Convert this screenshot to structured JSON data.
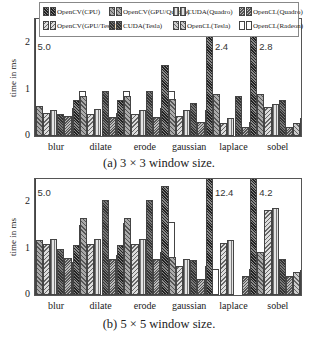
{
  "chart_data": [
    {
      "type": "bar",
      "title": "(a) 3 × 3 window size.",
      "xlabel": "",
      "ylabel": "time in ms",
      "ylim": [
        0,
        2.5
      ],
      "yticks": [
        "0",
        "1",
        "2"
      ],
      "grid": false,
      "legend_position": "top inside",
      "categories": [
        "blur",
        "dilate",
        "erode",
        "gaussian",
        "laplace",
        "sobel"
      ],
      "series_label_note": "Bar slots are ordered left to right within each group. Slot 1 is OpenCV(CPU) (dark crosshatch, tallest) and slot 8 is OpenCL(Radeon) (white bar). The labels on slots 2-7 are inferred from legend order and were not confirmed by matching bar fill to legend swatch.",
      "series": [
        {
          "slot": 1,
          "name": "OpenCV(CPU)",
          "label_confidence": "confirmed",
          "values": [
            5.0,
            0.77,
            0.77,
            1.52,
            2.4,
            2.8
          ]
        },
        {
          "slot": 2,
          "name": "OpenCV(GPU/Quadro)",
          "label_confidence": "inferred",
          "values": [
            0.65,
            0.85,
            0.85,
            0.8,
            0.9,
            0.9
          ]
        },
        {
          "slot": 3,
          "name": "OpenCV(GPU/Tesla)",
          "label_confidence": "inferred",
          "values": [
            0.5,
            0.48,
            0.47,
            0.44,
            0.27,
            0.62
          ]
        },
        {
          "slot": 4,
          "name": "CUDA(Quadro)",
          "label_confidence": "inferred",
          "values": [
            0.57,
            0.58,
            0.57,
            0.55,
            0.38,
            0.68
          ]
        },
        {
          "slot": 5,
          "name": "CUDA(Tesla)",
          "label_confidence": "inferred",
          "values": [
            0.48,
            0.97,
            0.97,
            0.72,
            0.87,
            0.78
          ]
        },
        {
          "slot": 6,
          "name": "OpenCL(Quadro)",
          "label_confidence": "inferred",
          "values": [
            0.42,
            0.4,
            0.4,
            0.3,
            0.2,
            0.2
          ]
        },
        {
          "slot": 7,
          "name": "OpenCL(Tesla)",
          "label_confidence": "inferred",
          "values": [
            0.6,
            0.5,
            0.6,
            0.55,
            0.3,
            0.27
          ]
        },
        {
          "slot": 8,
          "name": "OpenCL(Radeon)",
          "label_confidence": "confirmed",
          "values": [
            0.97,
            0.97,
            0.97,
            0.5,
            0.4,
            0.38
          ]
        }
      ],
      "annotations": [
        {
          "category": "blur",
          "text": "5.0"
        },
        {
          "category": "laplace",
          "text": "2.4"
        },
        {
          "category": "sobel",
          "text": "2.8"
        }
      ]
    },
    {
      "type": "bar",
      "title": "(b) 5 × 5 window size.",
      "xlabel": "",
      "ylabel": "time in ms",
      "ylim": [
        0,
        2.5
      ],
      "yticks": [
        "0",
        "1",
        "2"
      ],
      "grid": false,
      "categories": [
        "blur",
        "dilate",
        "erode",
        "gaussian",
        "laplace",
        "sobel"
      ],
      "series_label_note": "Same slot ordering and label caveat as panel (a).",
      "series": [
        {
          "slot": 1,
          "name": "OpenCV(CPU)",
          "label_confidence": "confirmed",
          "values": [
            5.0,
            1.07,
            1.07,
            2.35,
            12.4,
            4.2
          ]
        },
        {
          "slot": 2,
          "name": "OpenCV(GPU/Quadro)",
          "label_confidence": "inferred",
          "values": [
            1.18,
            1.65,
            1.65,
            0.82,
            0,
            0.93
          ]
        },
        {
          "slot": 3,
          "name": "OpenCV(GPU/Tesla)",
          "label_confidence": "inferred",
          "values": [
            1.1,
            1.1,
            1.1,
            0.63,
            1.12,
            1.82
          ]
        },
        {
          "slot": 4,
          "name": "CUDA(Quadro)",
          "label_confidence": "inferred",
          "values": [
            1.2,
            1.2,
            1.2,
            0.77,
            1.18,
            1.88
          ]
        },
        {
          "slot": 5,
          "name": "CUDA(Tesla)",
          "label_confidence": "inferred",
          "values": [
            1.0,
            2.05,
            2.05,
            0.75,
            0,
            0.78
          ]
        },
        {
          "slot": 6,
          "name": "OpenCL(Quadro)",
          "label_confidence": "inferred",
          "values": [
            0.8,
            0.78,
            0.78,
            0.35,
            0.4,
            0.4
          ]
        },
        {
          "slot": 7,
          "name": "OpenCL(Tesla)",
          "label_confidence": "inferred",
          "values": [
            0.7,
            0.87,
            0.93,
            0.63,
            0.55,
            0.5
          ]
        },
        {
          "slot": 8,
          "name": "OpenCL(Radeon)",
          "label_confidence": "confirmed",
          "values": [
            1.5,
            1.55,
            1.57,
            0.55,
            0.67,
            0.53
          ]
        }
      ],
      "annotations": [
        {
          "category": "blur",
          "text": "5.0"
        },
        {
          "category": "laplace",
          "text": "12.4"
        },
        {
          "category": "sobel",
          "text": "4.2"
        }
      ]
    }
  ],
  "legend": [
    {
      "label": "OpenCV(CPU)",
      "pattern": "p0"
    },
    {
      "label": "OpenCV(GPU/Quadro)",
      "pattern": "p1"
    },
    {
      "label": "CUDA(Quadro)",
      "pattern": "p3"
    },
    {
      "label": "OpenCL(Quadro)",
      "pattern": "p5"
    },
    {
      "label": "OpenCV(GPU/Tesla)",
      "pattern": "p2"
    },
    {
      "label": "CUDA(Tesla)",
      "pattern": "p4"
    },
    {
      "label": "OpenCL(Tesla)",
      "pattern": "p6"
    },
    {
      "label": "OpenCL(Radeon)",
      "pattern": "p7"
    }
  ],
  "captions": {
    "a": "(a) 3 × 3 window size.",
    "b": "(b) 5 × 5 window size."
  },
  "axis": {
    "ylabel": "time in ms",
    "ticks": [
      "0",
      "1",
      "2"
    ]
  }
}
